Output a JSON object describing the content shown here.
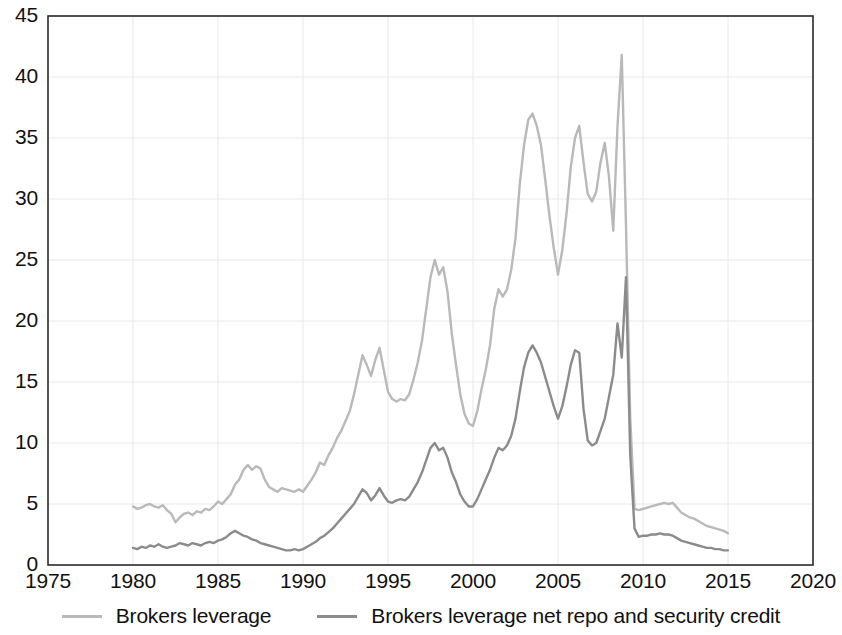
{
  "chart_data": {
    "type": "line",
    "title": "",
    "subtitle": "",
    "xlabel": "",
    "ylabel": "",
    "xlim": [
      1975,
      2020
    ],
    "ylim": [
      0,
      45
    ],
    "grid": true,
    "legend_position": "bottom",
    "x_ticks": [
      "1975",
      "1980",
      "1985",
      "1990",
      "1995",
      "2000",
      "2005",
      "2010",
      "2015",
      "2020"
    ],
    "y_ticks": [
      "0",
      "5",
      "10",
      "15",
      "20",
      "25",
      "30",
      "35",
      "40",
      "45"
    ],
    "colors": {
      "brokers_leverage": "#b9b9b9",
      "brokers_leverage_net": "#8b8b8b",
      "axis": "#2a2a2a",
      "grid": "#e8e8e8",
      "background": "#ffffff"
    },
    "series": [
      {
        "name": "Brokers leverage",
        "color": "#b9b9b9",
        "x": [
          1980.0,
          1980.25,
          1980.5,
          1980.75,
          1981.0,
          1981.25,
          1981.5,
          1981.75,
          1982.0,
          1982.25,
          1982.5,
          1982.75,
          1983.0,
          1983.25,
          1983.5,
          1983.75,
          1984.0,
          1984.25,
          1984.5,
          1984.75,
          1985.0,
          1985.25,
          1985.5,
          1985.75,
          1986.0,
          1986.25,
          1986.5,
          1986.75,
          1987.0,
          1987.25,
          1987.5,
          1987.75,
          1988.0,
          1988.25,
          1988.5,
          1988.75,
          1989.0,
          1989.25,
          1989.5,
          1989.75,
          1990.0,
          1990.25,
          1990.5,
          1990.75,
          1991.0,
          1991.25,
          1991.5,
          1991.75,
          1992.0,
          1992.25,
          1992.5,
          1992.75,
          1993.0,
          1993.25,
          1993.5,
          1993.75,
          1994.0,
          1994.25,
          1994.5,
          1994.75,
          1995.0,
          1995.25,
          1995.5,
          1995.75,
          1996.0,
          1996.25,
          1996.5,
          1996.75,
          1997.0,
          1997.25,
          1997.5,
          1997.75,
          1998.0,
          1998.25,
          1998.5,
          1998.75,
          1999.0,
          1999.25,
          1999.5,
          1999.75,
          2000.0,
          2000.25,
          2000.5,
          2000.75,
          2001.0,
          2001.25,
          2001.5,
          2001.75,
          2002.0,
          2002.25,
          2002.5,
          2002.75,
          2003.0,
          2003.25,
          2003.5,
          2003.75,
          2004.0,
          2004.25,
          2004.5,
          2004.75,
          2005.0,
          2005.25,
          2005.5,
          2005.75,
          2006.0,
          2006.25,
          2006.5,
          2006.75,
          2007.0,
          2007.25,
          2007.5,
          2007.75,
          2008.0,
          2008.25,
          2008.5,
          2008.75,
          2009.0,
          2009.25,
          2009.5,
          2009.75,
          2010.0,
          2010.25,
          2010.5,
          2010.75,
          2011.0,
          2011.25,
          2011.5,
          2011.75,
          2012.0,
          2012.25,
          2012.5,
          2012.75,
          2013.0,
          2013.25,
          2013.5,
          2013.75,
          2014.0,
          2014.25,
          2014.5,
          2014.75,
          2015.0
        ],
        "y": [
          4.8,
          4.6,
          4.7,
          4.9,
          5.0,
          4.8,
          4.7,
          4.9,
          4.5,
          4.2,
          3.5,
          3.9,
          4.2,
          4.3,
          4.1,
          4.4,
          4.3,
          4.6,
          4.5,
          4.8,
          5.2,
          5.0,
          5.4,
          5.8,
          6.6,
          7.0,
          7.8,
          8.2,
          7.8,
          8.1,
          7.9,
          7.0,
          6.4,
          6.2,
          6.0,
          6.3,
          6.2,
          6.1,
          6.0,
          6.2,
          6.0,
          6.5,
          7.0,
          7.6,
          8.4,
          8.2,
          9.0,
          9.6,
          10.4,
          11.0,
          11.8,
          12.6,
          14.0,
          15.6,
          17.2,
          16.4,
          15.5,
          16.8,
          17.8,
          16.0,
          14.2,
          13.6,
          13.4,
          13.6,
          13.5,
          14.0,
          15.2,
          16.6,
          18.4,
          21.0,
          23.6,
          25.0,
          23.8,
          24.4,
          22.4,
          19.0,
          16.4,
          14.0,
          12.4,
          11.6,
          11.4,
          12.6,
          14.4,
          16.0,
          18.0,
          21.0,
          22.6,
          22.0,
          22.6,
          24.2,
          26.8,
          31.2,
          34.4,
          36.5,
          37.0,
          36.0,
          34.4,
          31.6,
          28.6,
          26.0,
          23.8,
          25.8,
          28.8,
          32.6,
          35.0,
          36.0,
          33.0,
          30.4,
          29.8,
          30.6,
          33.0,
          34.6,
          31.8,
          27.4,
          36.0,
          41.8,
          27.8,
          12.0,
          4.6,
          4.5,
          4.6,
          4.7,
          4.8,
          4.9,
          5.0,
          5.1,
          5.0,
          5.1,
          4.7,
          4.3,
          4.1,
          3.9,
          3.8,
          3.6,
          3.4,
          3.2,
          3.1,
          3.0,
          2.9,
          2.8,
          2.6
        ]
      },
      {
        "name": "Brokers leverage net repo and security credit",
        "color": "#8b8b8b",
        "x": [
          1980.0,
          1980.25,
          1980.5,
          1980.75,
          1981.0,
          1981.25,
          1981.5,
          1981.75,
          1982.0,
          1982.25,
          1982.5,
          1982.75,
          1983.0,
          1983.25,
          1983.5,
          1983.75,
          1984.0,
          1984.25,
          1984.5,
          1984.75,
          1985.0,
          1985.25,
          1985.5,
          1985.75,
          1986.0,
          1986.25,
          1986.5,
          1986.75,
          1987.0,
          1987.25,
          1987.5,
          1987.75,
          1988.0,
          1988.25,
          1988.5,
          1988.75,
          1989.0,
          1989.25,
          1989.5,
          1989.75,
          1990.0,
          1990.25,
          1990.5,
          1990.75,
          1991.0,
          1991.25,
          1991.5,
          1991.75,
          1992.0,
          1992.25,
          1992.5,
          1992.75,
          1993.0,
          1993.25,
          1993.5,
          1993.75,
          1994.0,
          1994.25,
          1994.5,
          1994.75,
          1995.0,
          1995.25,
          1995.5,
          1995.75,
          1996.0,
          1996.25,
          1996.5,
          1996.75,
          1997.0,
          1997.25,
          1997.5,
          1997.75,
          1998.0,
          1998.25,
          1998.5,
          1998.75,
          1999.0,
          1999.25,
          1999.5,
          1999.75,
          2000.0,
          2000.25,
          2000.5,
          2000.75,
          2001.0,
          2001.25,
          2001.5,
          2001.75,
          2002.0,
          2002.25,
          2002.5,
          2002.75,
          2003.0,
          2003.25,
          2003.5,
          2003.75,
          2004.0,
          2004.25,
          2004.5,
          2004.75,
          2005.0,
          2005.25,
          2005.5,
          2005.75,
          2006.0,
          2006.25,
          2006.5,
          2006.75,
          2007.0,
          2007.25,
          2007.5,
          2007.75,
          2008.0,
          2008.25,
          2008.5,
          2008.75,
          2009.0,
          2009.25,
          2009.5,
          2009.75,
          2010.0,
          2010.25,
          2010.5,
          2010.75,
          2011.0,
          2011.25,
          2011.5,
          2011.75,
          2012.0,
          2012.25,
          2012.5,
          2012.75,
          2013.0,
          2013.25,
          2013.5,
          2013.75,
          2014.0,
          2014.25,
          2014.5,
          2014.75,
          2015.0
        ],
        "y": [
          1.4,
          1.3,
          1.5,
          1.4,
          1.6,
          1.5,
          1.7,
          1.5,
          1.4,
          1.5,
          1.6,
          1.8,
          1.7,
          1.6,
          1.8,
          1.7,
          1.6,
          1.8,
          1.9,
          1.8,
          2.0,
          2.1,
          2.3,
          2.6,
          2.8,
          2.6,
          2.4,
          2.3,
          2.1,
          2.0,
          1.8,
          1.7,
          1.6,
          1.5,
          1.4,
          1.3,
          1.2,
          1.2,
          1.3,
          1.2,
          1.3,
          1.5,
          1.7,
          1.9,
          2.2,
          2.4,
          2.7,
          3.0,
          3.4,
          3.8,
          4.2,
          4.6,
          5.0,
          5.6,
          6.2,
          5.9,
          5.3,
          5.7,
          6.3,
          5.7,
          5.2,
          5.1,
          5.3,
          5.4,
          5.3,
          5.6,
          6.2,
          6.8,
          7.6,
          8.6,
          9.6,
          10.0,
          9.4,
          9.6,
          8.8,
          7.6,
          6.8,
          5.8,
          5.2,
          4.8,
          4.8,
          5.4,
          6.2,
          7.0,
          7.8,
          8.8,
          9.6,
          9.4,
          9.8,
          10.6,
          12.0,
          14.2,
          16.2,
          17.4,
          18.0,
          17.4,
          16.6,
          15.4,
          14.2,
          13.0,
          12.0,
          13.0,
          14.6,
          16.4,
          17.6,
          17.4,
          12.8,
          10.2,
          9.8,
          10.0,
          11.0,
          12.0,
          13.8,
          15.6,
          19.8,
          17.0,
          23.6,
          9.0,
          3.0,
          2.3,
          2.4,
          2.4,
          2.5,
          2.5,
          2.6,
          2.5,
          2.5,
          2.4,
          2.2,
          2.0,
          1.9,
          1.8,
          1.7,
          1.6,
          1.5,
          1.4,
          1.4,
          1.3,
          1.3,
          1.2,
          1.2
        ]
      }
    ],
    "legend": [
      {
        "label": "Brokers leverage",
        "color": "#b9b9b9"
      },
      {
        "label": "Brokers leverage net repo and security credit",
        "color": "#8b8b8b"
      }
    ]
  }
}
